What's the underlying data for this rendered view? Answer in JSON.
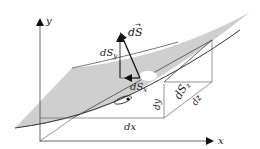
{
  "diagram": {
    "axes": {
      "x_label": "x",
      "y_label": "y"
    },
    "vector": {
      "label_d": "d",
      "label_S": "S",
      "arrow": "→"
    },
    "components": {
      "dSy": {
        "d": "dS",
        "sub": "y"
      },
      "dSx": {
        "d": "dS",
        "sub": "x"
      },
      "dSz": {
        "d": "dS",
        "sub": "z"
      }
    },
    "edges": {
      "dx": "dx",
      "dy": "dy",
      "dz": "dz"
    },
    "colors": {
      "surface": "#cfcfcf",
      "lines": "#444444",
      "background": "#ffffff"
    }
  }
}
